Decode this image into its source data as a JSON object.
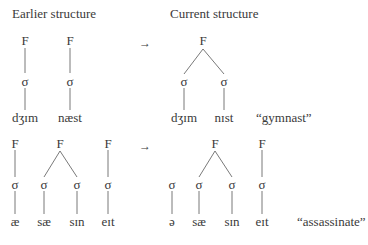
{
  "headings": {
    "earlier": "Earlier structure",
    "current": "Current structure"
  },
  "symbols": {
    "foot": "F",
    "syllable": "σ",
    "arrow": "→"
  },
  "examples": [
    {
      "gloss": "“gymnast”",
      "earlier": {
        "feet": [
          {
            "syllables": [
              "dʒɪm"
            ]
          },
          {
            "syllables": [
              "næst"
            ]
          }
        ]
      },
      "current": {
        "feet": [
          {
            "syllables": [
              "dʒɪm",
              "nɪst"
            ]
          }
        ]
      }
    },
    {
      "gloss": "“assassinate”",
      "earlier": {
        "feet": [
          {
            "syllables": [
              "æ"
            ]
          },
          {
            "syllables": [
              "sæ",
              "sɪn"
            ]
          },
          {
            "syllables": [
              "eɪt"
            ]
          }
        ]
      },
      "current": {
        "unfooted": [
          "ə"
        ],
        "feet": [
          {
            "syllables": [
              "sæ",
              "sɪn"
            ]
          },
          {
            "syllables": [
              "eɪt"
            ]
          }
        ]
      }
    }
  ]
}
